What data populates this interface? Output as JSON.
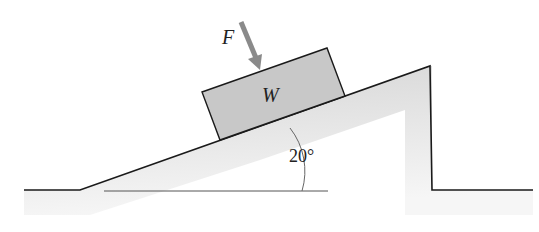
{
  "diagram": {
    "force_label": "F",
    "block_label": "W",
    "angle_label": "20°",
    "colors": {
      "block_fill": "#c8c8c8",
      "arrow": "#8a8a8a",
      "ground_shade": "#e6e6e6",
      "line": "#1a1a1a"
    }
  }
}
